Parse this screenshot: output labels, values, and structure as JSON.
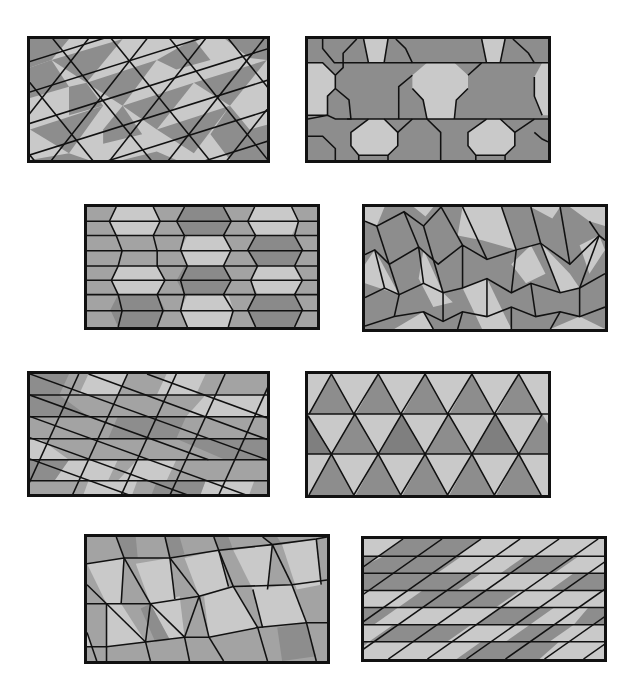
{
  "figure": {
    "colors": {
      "light": "#c9c9c9",
      "medium": "#a3a3a3",
      "dark": "#8d8d8d",
      "edge": "#111111",
      "background": "#ffffff"
    },
    "panels": [
      {
        "id": "p1",
        "tiling": "triangles-and-parallelograms-slanted",
        "x": 27,
        "y": 36,
        "w": 243,
        "h": 127
      },
      {
        "id": "p2",
        "tiling": "truncated-octagons-and-bowties",
        "x": 305,
        "y": 36,
        "w": 246,
        "h": 127
      },
      {
        "id": "p3",
        "tiling": "elongated-hexagon-columns",
        "x": 84,
        "y": 204,
        "w": 236,
        "h": 126
      },
      {
        "id": "p4",
        "tiling": "zigzag-darts",
        "x": 362,
        "y": 204,
        "w": 246,
        "h": 128
      },
      {
        "id": "p5",
        "tiling": "horizontal-bands-with-diagonal-triangles",
        "x": 27,
        "y": 371,
        "w": 243,
        "h": 126
      },
      {
        "id": "p6",
        "tiling": "equilateral-triangles-in-rows",
        "x": 305,
        "y": 371,
        "w": 246,
        "h": 127
      },
      {
        "id": "p7",
        "tiling": "skewed-quadrilaterals",
        "x": 84,
        "y": 534,
        "w": 246,
        "h": 130
      },
      {
        "id": "p8",
        "tiling": "horizontal-bands-of-parallelograms",
        "x": 361,
        "y": 536,
        "w": 246,
        "h": 126
      }
    ]
  }
}
